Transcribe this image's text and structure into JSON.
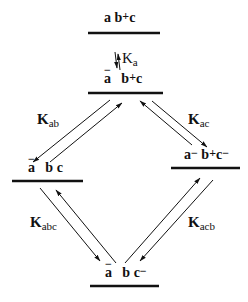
{
  "diagram": {
    "type": "kinetic-scheme",
    "states": [
      {
        "id": "top",
        "label": "a b⁺c",
        "parts": [
          "a",
          "b",
          "+",
          "c"
        ]
      },
      {
        "id": "mid",
        "label": "a⁻ b⁺c",
        "parts": [
          "a",
          "−",
          "b",
          "+",
          "c"
        ]
      },
      {
        "id": "left",
        "label": "a⁻ b c",
        "parts": [
          "a",
          "−",
          "b c"
        ]
      },
      {
        "id": "right",
        "label": "a⁻ b⁺c⁻",
        "parts": [
          "a",
          "−",
          "b",
          "+",
          "c",
          "−"
        ]
      },
      {
        "id": "bottom",
        "label": "a⁻ b c⁻",
        "parts": [
          "a",
          "−",
          "b c",
          "−"
        ]
      }
    ],
    "constants": [
      {
        "id": "Ka",
        "main": "K",
        "sub": "a",
        "between": [
          "top",
          "mid"
        ]
      },
      {
        "id": "Kab",
        "main": "K",
        "sub": "ab",
        "between": [
          "mid",
          "left"
        ]
      },
      {
        "id": "Kac",
        "main": "K",
        "sub": "ac",
        "between": [
          "mid",
          "right"
        ]
      },
      {
        "id": "Kabc",
        "main": "K",
        "sub": "abc",
        "between": [
          "left",
          "bottom"
        ]
      },
      {
        "id": "Kacb",
        "main": "K",
        "sub": "acb",
        "between": [
          "right",
          "bottom"
        ]
      }
    ],
    "line_color": "#111111"
  }
}
